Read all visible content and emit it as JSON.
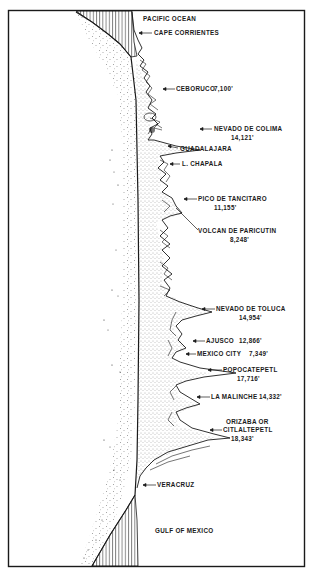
{
  "figure": {
    "type": "volcanic-profile-map",
    "colors": {
      "ink": "#1a1a1a",
      "background": "#ffffff"
    }
  },
  "regions": {
    "top": "PACIFIC OCEAN",
    "bottom": "GULF OF MEXICO"
  },
  "labels": [
    {
      "id": "cape-corrientes",
      "name": "CAPE CORRIENTES",
      "elevation": ""
    },
    {
      "id": "ceboruco",
      "name": "CEBORUCO",
      "elevation": "7,100'"
    },
    {
      "id": "nevado-de-colima",
      "name": "NEVADO DE COLIMA",
      "elevation": "14,121'"
    },
    {
      "id": "guadalajara",
      "name": "GUADALAJARA",
      "elevation": ""
    },
    {
      "id": "l-chapala",
      "name": "L. CHAPALA",
      "elevation": ""
    },
    {
      "id": "pico-de-tancitaro",
      "name": "PICO DE TANCITARO",
      "elevation": "11,155'"
    },
    {
      "id": "volcan-de-paricutin",
      "name": "VOLCAN DE PARICUTIN",
      "elevation": "8,248'"
    },
    {
      "id": "nevado-de-toluca",
      "name": "NEVADO DE TOLUCA",
      "elevation": "14,954'"
    },
    {
      "id": "ajusco",
      "name": "AJUSCO",
      "elevation": "12,866'"
    },
    {
      "id": "mexico-city",
      "name": "MEXICO CITY",
      "elevation": "7,349'"
    },
    {
      "id": "popocatepetl",
      "name": "POPOCATEPETL",
      "elevation": "17,716'"
    },
    {
      "id": "la-malinche",
      "name": "LA MALINCHE",
      "elevation": "14,332'"
    },
    {
      "id": "orizaba",
      "name": "ORIZABA OR",
      "name2": "CITLALTEPETL",
      "elevation": "18,343'"
    },
    {
      "id": "veracruz",
      "name": "VERACRUZ",
      "elevation": ""
    }
  ]
}
